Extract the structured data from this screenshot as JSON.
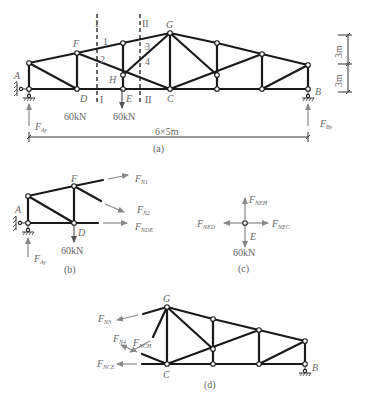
{
  "figure": {
    "panels": [
      {
        "id": "a",
        "caption": "(a)",
        "nodes": [
          "A",
          "F",
          "D",
          "E",
          "H",
          "G",
          "C",
          "B"
        ],
        "section_labels": [
          "I",
          "I",
          "II",
          "II"
        ],
        "member_numbers": [
          "1",
          "2",
          "3",
          "4"
        ],
        "loads": [
          "60kN",
          "60kN"
        ],
        "reactions": {
          "left": "F",
          "left_sub": "Ay",
          "right": "F",
          "right_sub": "By"
        },
        "span_label": "6×5m",
        "height_labels": [
          "3m",
          "3m"
        ]
      },
      {
        "id": "b",
        "caption": "(b)",
        "nodes": [
          "A",
          "F",
          "D"
        ],
        "load": "60kN",
        "forces": [
          {
            "name": "F",
            "sub": "N1"
          },
          {
            "name": "F",
            "sub": "N2"
          },
          {
            "name": "F",
            "sub": "NDE"
          }
        ],
        "reaction": {
          "name": "F",
          "sub": "Ay"
        }
      },
      {
        "id": "c",
        "caption": "(c)",
        "node": "E",
        "load": "60kN",
        "forces": [
          {
            "name": "F",
            "sub": "NEH"
          },
          {
            "name": "F",
            "sub": "NED"
          },
          {
            "name": "F",
            "sub": "NEC"
          }
        ]
      },
      {
        "id": "d",
        "caption": "(d)",
        "nodes": [
          "G",
          "C",
          "B"
        ],
        "forces": [
          {
            "name": "F",
            "sub": "N3"
          },
          {
            "name": "F",
            "sub": "N4"
          },
          {
            "name": "F",
            "sub": "NCH"
          },
          {
            "name": "F",
            "sub": "NCE"
          }
        ]
      }
    ]
  }
}
